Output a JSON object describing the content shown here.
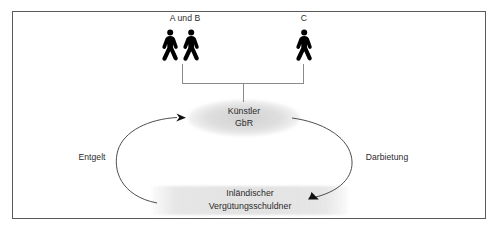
{
  "diagram": {
    "type": "relationship-diagram",
    "language": "de",
    "frame": {
      "border_color": "#5a5a5a",
      "background": "#ffffff"
    },
    "nodes": [
      {
        "id": "person-group-ab",
        "kind": "person-icons",
        "label": "A und B",
        "icon": "pedestrian-icon",
        "count": 2,
        "icon_color": "#000000"
      },
      {
        "id": "person-c",
        "kind": "person-icon",
        "label": "C",
        "icon": "pedestrian-icon",
        "count": 1,
        "icon_color": "#000000"
      },
      {
        "id": "kuenstler-gbr",
        "kind": "ellipse",
        "label_line1": "Künstler",
        "label_line2": "GbR",
        "fill": "#d6d6d6"
      },
      {
        "id": "inlaendischer-verguetungsschuldner",
        "kind": "band",
        "label_line1": "Inländischer",
        "label_line2": "Vergütungsschuldner",
        "fill": "#e2e2e2"
      }
    ],
    "edges": [
      {
        "id": "bracket-members-to-gbr",
        "kind": "bracket-connector",
        "from": [
          "person-group-ab",
          "person-c"
        ],
        "to": "kuenstler-gbr",
        "label": "",
        "stroke": "#808080",
        "arrow": false
      },
      {
        "id": "edge-entgelt",
        "kind": "curved-arrow",
        "from": "inlaendischer-verguetungsschuldner",
        "to": "kuenstler-gbr",
        "label": "Entgelt",
        "stroke": "#3a3a3a",
        "arrow": true,
        "direction": "upward-left-side"
      },
      {
        "id": "edge-darbietung",
        "kind": "curved-arrow",
        "from": "kuenstler-gbr",
        "to": "inlaendischer-verguetungsschuldner",
        "label": "Darbietung",
        "stroke": "#3a3a3a",
        "arrow": true,
        "direction": "downward-right-side"
      }
    ],
    "text_color": "#2b2b2b"
  }
}
